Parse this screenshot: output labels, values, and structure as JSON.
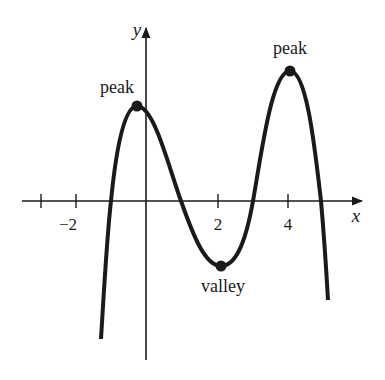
{
  "diagram": {
    "axes": {
      "x_label": "x",
      "y_label": "y",
      "x_ticks": [
        {
          "value": -3,
          "label": ""
        },
        {
          "value": -2,
          "label": "−2"
        },
        {
          "value": 2,
          "label": "2"
        },
        {
          "value": 4,
          "label": "4"
        }
      ]
    },
    "annotations": {
      "peak_left": "peak",
      "peak_right": "peak",
      "valley": "valley"
    },
    "colors": {
      "curve": "#1a1a1a",
      "axis": "#1a1a1a",
      "background": "#ffffff"
    }
  }
}
